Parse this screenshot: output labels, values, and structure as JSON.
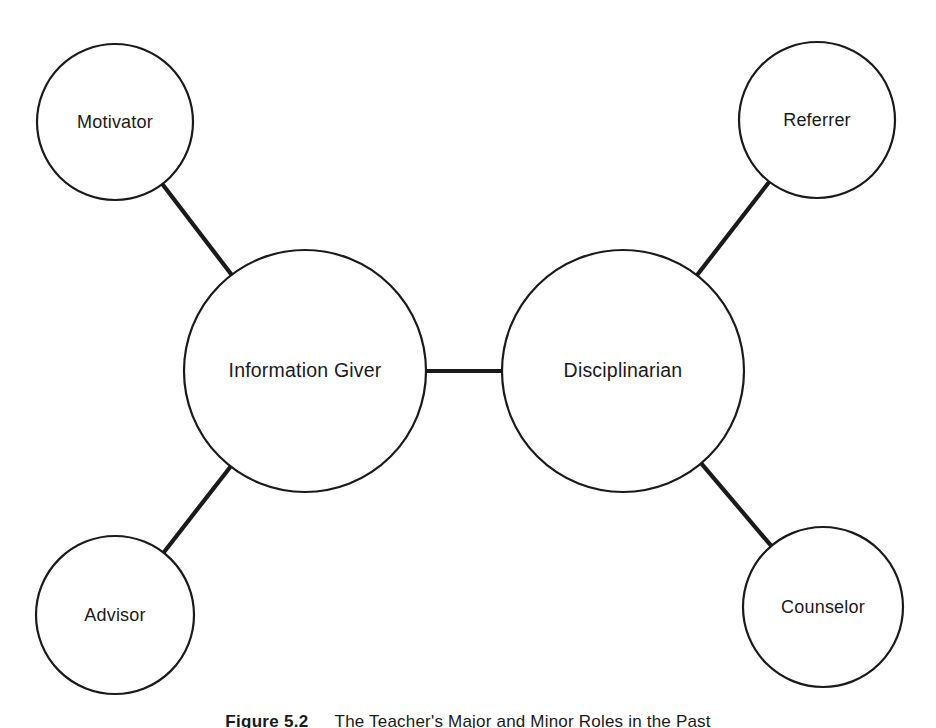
{
  "figure": {
    "caption_label": "Figure 5.2",
    "caption_text": "The Teacher's Major and Minor Roles in the Past",
    "background_color": "#ffffff",
    "line_color": "#1a1a1a"
  },
  "diagram": {
    "type": "node-link-diagram",
    "nodes": [
      {
        "id": "motivator",
        "label": "Motivator",
        "role": "minor",
        "cx": 115,
        "cy": 122,
        "r": 78
      },
      {
        "id": "referrer",
        "label": "Referrer",
        "role": "minor",
        "cx": 817,
        "cy": 120,
        "r": 78
      },
      {
        "id": "information-giver",
        "label": "Information Giver",
        "role": "major",
        "cx": 305,
        "cy": 371,
        "r": 121
      },
      {
        "id": "disciplinarian",
        "label": "Disciplinarian",
        "role": "major",
        "cx": 623,
        "cy": 371,
        "r": 121
      },
      {
        "id": "advisor",
        "label": "Advisor",
        "role": "minor",
        "cx": 115,
        "cy": 615,
        "r": 79
      },
      {
        "id": "counselor",
        "label": "Counselor",
        "role": "minor",
        "cx": 823,
        "cy": 607,
        "r": 80
      }
    ],
    "edges": [
      {
        "id": "edge-motivator-information-giver",
        "from": "motivator",
        "to": "information-giver"
      },
      {
        "id": "edge-advisor-information-giver",
        "from": "advisor",
        "to": "information-giver"
      },
      {
        "id": "edge-information-giver-disciplinarian",
        "from": "information-giver",
        "to": "disciplinarian"
      },
      {
        "id": "edge-referrer-disciplinarian",
        "from": "referrer",
        "to": "disciplinarian"
      },
      {
        "id": "edge-counselor-disciplinarian",
        "from": "counselor",
        "to": "disciplinarian"
      }
    ]
  }
}
